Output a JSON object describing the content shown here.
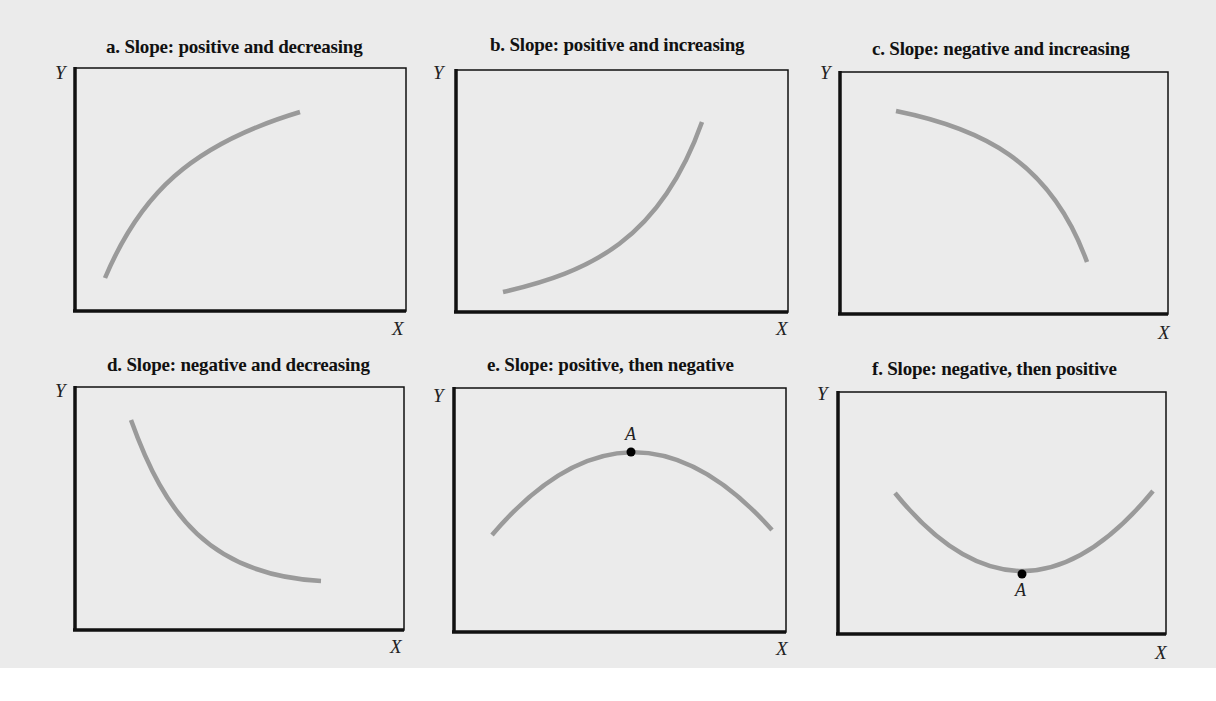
{
  "figure": {
    "panels": [
      {
        "id": "a",
        "title": "a. Slope: positive and decreasing",
        "y_label": "Y",
        "x_label": "X"
      },
      {
        "id": "b",
        "title": "b. Slope: positive and increasing",
        "y_label": "Y",
        "x_label": "X"
      },
      {
        "id": "c",
        "title": "c. Slope: negative and increasing",
        "y_label": "Y",
        "x_label": "X"
      },
      {
        "id": "d",
        "title": "d. Slope: negative and decreasing",
        "y_label": "Y",
        "x_label": "X"
      },
      {
        "id": "e",
        "title": "e. Slope: positive, then negative",
        "y_label": "Y",
        "x_label": "X",
        "point_label": "A"
      },
      {
        "id": "f",
        "title": "f. Slope: negative, then positive",
        "y_label": "Y",
        "x_label": "X",
        "point_label": "A"
      }
    ],
    "colors": {
      "curve": "#9a9a9a",
      "axis": "#111111",
      "point": "#000000",
      "background": "#ebebeb"
    }
  }
}
